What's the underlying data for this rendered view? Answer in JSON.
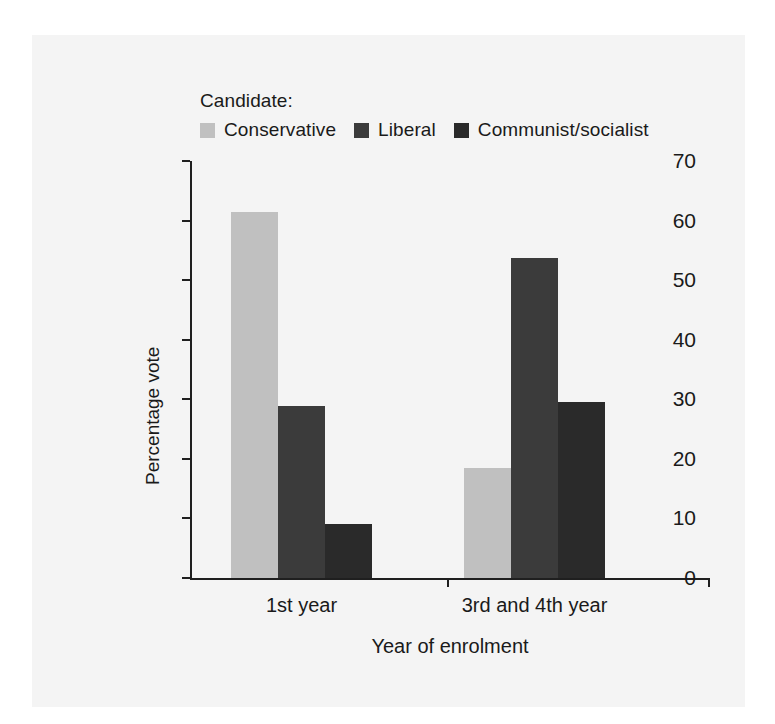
{
  "figure": {
    "legend_title": "Candidate:",
    "background_color": "#f4f4f4"
  },
  "chart_data": {
    "type": "bar",
    "title": "",
    "categories": [
      "1st year",
      "3rd and 4th year"
    ],
    "series": [
      {
        "name": "Conservative",
        "values": [
          61.5,
          18.5
        ],
        "color": "#c0c0c0"
      },
      {
        "name": "Liberal",
        "values": [
          28.8,
          53.8
        ],
        "color": "#3b3b3b"
      },
      {
        "name": "Communist/socialist",
        "values": [
          9.1,
          29.6
        ],
        "color": "#2a2a2a"
      }
    ],
    "xlabel": "Year of enrolment",
    "ylabel": "Percentage vote",
    "ylim": [
      0,
      70
    ],
    "yticks": [
      0,
      10,
      20,
      30,
      40,
      50,
      60,
      70
    ],
    "ytick_labels": [
      "0",
      "10",
      "20",
      "30",
      "40",
      "50",
      "60",
      "70"
    ],
    "grid": false,
    "legend_position": "above-plot"
  }
}
